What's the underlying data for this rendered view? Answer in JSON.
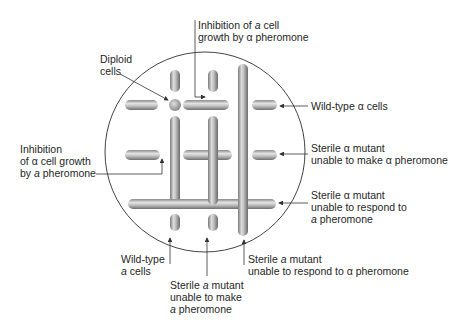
{
  "plate": {
    "shape": "circle",
    "center": [
      205,
      152
    ],
    "radius": 100
  },
  "rods": {
    "vertical": [
      {
        "id": "col1-top",
        "x": 175,
        "y1": 70,
        "y2": 92
      },
      {
        "id": "col1-mid",
        "x": 175,
        "y1": 116,
        "y2": 205
      },
      {
        "id": "col1-bottom",
        "x": 175,
        "y1": 214,
        "y2": 230
      },
      {
        "id": "col2-top",
        "x": 213,
        "y1": 70,
        "y2": 92
      },
      {
        "id": "col2-mid",
        "x": 213,
        "y1": 116,
        "y2": 205
      },
      {
        "id": "col2-bottom",
        "x": 213,
        "y1": 214,
        "y2": 230
      },
      {
        "id": "col3-long",
        "x": 243,
        "y1": 64,
        "y2": 236
      }
    ],
    "horizontal": [
      {
        "id": "row1-left",
        "y": 105,
        "x1": 125,
        "x2": 158
      },
      {
        "id": "row1-mid",
        "y": 105,
        "x1": 183,
        "x2": 229
      },
      {
        "id": "row1-right",
        "y": 105,
        "x1": 252,
        "x2": 277
      },
      {
        "id": "row2-left",
        "y": 155,
        "x1": 125,
        "x2": 160
      },
      {
        "id": "row2-mid",
        "y": 155,
        "x1": 183,
        "x2": 232
      },
      {
        "id": "row2-right",
        "y": 155,
        "x1": 252,
        "x2": 277
      },
      {
        "id": "row3-long",
        "y": 204,
        "x1": 128,
        "x2": 276
      }
    ],
    "diploid_dot": {
      "cx": 175,
      "cy": 105,
      "r": 6
    }
  },
  "labels": {
    "inhibition_a": {
      "line1_pre": "Inhibition of ",
      "line1_italic": "a",
      "line1_post": " cell",
      "line2": "growth by α pheromone"
    },
    "diploid": {
      "line1": "Diploid",
      "line2": "cells"
    },
    "wildtype_alpha": {
      "text": "Wild-type α cells"
    },
    "inhibition_alpha": {
      "line1": "Inhibition",
      "line2": "of α cell growth",
      "line3_pre": "by ",
      "line3_italic": "a",
      "line3_post": " pheromone"
    },
    "sterile_alpha_make": {
      "line1": "Sterile α mutant",
      "line2": "unable to make α pheromone"
    },
    "sterile_alpha_respond": {
      "line1": "Sterile α mutant",
      "line2": "unable to respond to",
      "line3_italic": "a",
      "line3_post": " pheromone"
    },
    "wildtype_a": {
      "line1": "Wild-type",
      "line2_italic": "a",
      "line2_post": " cells"
    },
    "sterile_a_make": {
      "line1_pre": "Sterile ",
      "line1_italic": "a",
      "line1_post": " mutant",
      "line2": "unable to make",
      "line3_italic": "a",
      "line3_post": " pheromone"
    },
    "sterile_a_respond": {
      "line1_pre": "Sterile ",
      "line1_italic": "a",
      "line1_post": " mutant",
      "line2": "unable to respond to α pheromone"
    }
  },
  "colors": {
    "rod_light": "#e6e6e6",
    "rod_mid": "#a8a8a8",
    "rod_dark": "#6e6e6e",
    "line": "#333333"
  }
}
